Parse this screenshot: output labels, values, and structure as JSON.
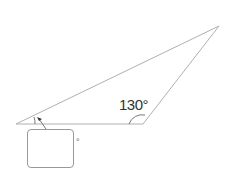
{
  "diagram": {
    "type": "triangle",
    "vertices": [
      {
        "name": "left",
        "x": 16,
        "y": 124
      },
      {
        "name": "obtuse",
        "x": 143,
        "y": 124
      },
      {
        "name": "top-right",
        "x": 219,
        "y": 26
      }
    ],
    "known_angle": {
      "vertex": "obtuse",
      "label": "130°"
    },
    "unknown_angle": {
      "vertex": "left",
      "answer_value": "",
      "unit": "°"
    }
  },
  "colors": {
    "line": "#aaaaaa",
    "text": "#333333"
  }
}
